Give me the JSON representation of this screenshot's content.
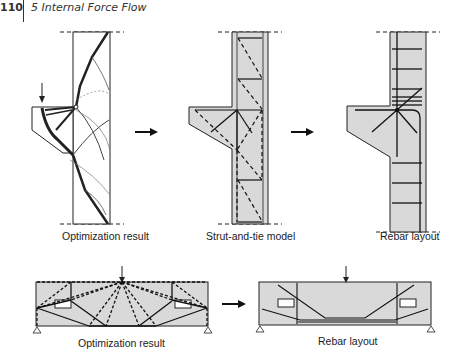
{
  "header": {
    "page_number": "110",
    "chapter_title": "5  Internal Force Flow"
  },
  "figures": {
    "top": [
      {
        "caption": "Optimization result"
      },
      {
        "caption": "Strut-and-tie model"
      },
      {
        "caption": "Rebar layout"
      }
    ],
    "bottom": [
      {
        "caption": "Optimization result"
      },
      {
        "caption": "Rebar layout"
      }
    ]
  },
  "colors": {
    "concrete_fill": "#d9d9d9",
    "line": "#1a1a1a"
  }
}
